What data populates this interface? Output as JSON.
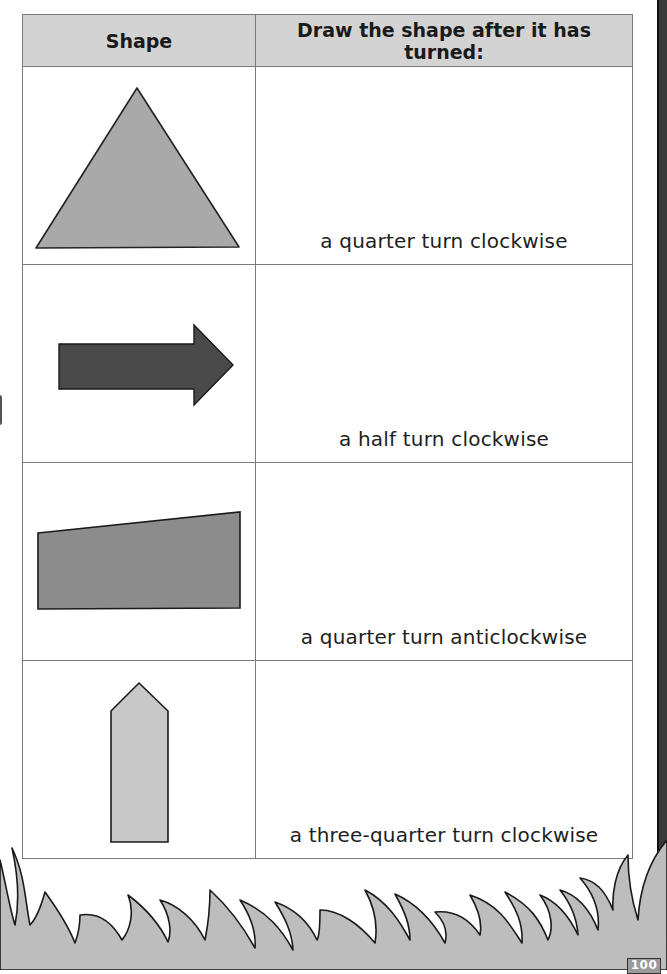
{
  "table": {
    "headers": [
      "Shape",
      "Draw the shape after it has turned:"
    ],
    "rows": [
      {
        "shape": "triangle",
        "instruction": "a quarter turn clockwise"
      },
      {
        "shape": "arrow-right",
        "instruction": "a half turn clockwise"
      },
      {
        "shape": "trapezium",
        "instruction": "a quarter turn anticlockwise"
      },
      {
        "shape": "pentagon-arrow-up",
        "instruction": "a three-quarter turn clockwise"
      }
    ]
  },
  "colors": {
    "header_bg": "#d3d3d3",
    "triangle_fill": "#a9a9a9",
    "arrow_fill": "#4a4a4a",
    "trapezium_fill": "#8c8c8c",
    "pentagon_fill": "#c8c8c8",
    "grass_fill": "#bdbdbd"
  },
  "footer": {
    "page_number": "100"
  }
}
